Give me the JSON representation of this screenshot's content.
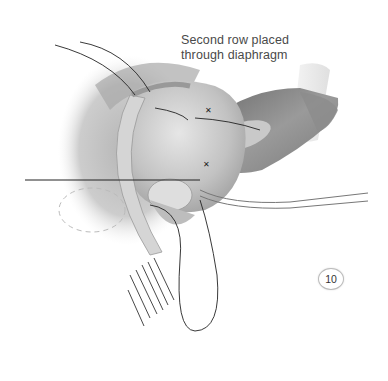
{
  "figure": {
    "caption_lines": [
      "Second row placed",
      "through diaphragm"
    ],
    "figure_number": "10",
    "colors": {
      "background": "#ffffff",
      "tissue_dark": "#8a8a8a",
      "tissue_mid": "#b5b5b5",
      "tissue_light": "#e2e2e2",
      "suture": "#222222",
      "caption_text": "#4a4a4a"
    }
  }
}
